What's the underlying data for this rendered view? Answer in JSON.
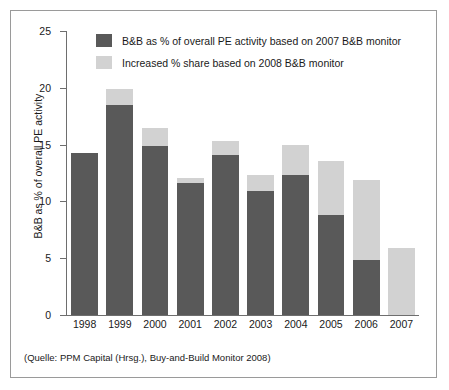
{
  "chart_data": {
    "type": "bar",
    "subtype": "stacked-vertical",
    "title": "",
    "xlabel": "",
    "ylabel": "B&B as % of overall PE activity",
    "ylim": [
      0,
      25
    ],
    "yticks": [
      0,
      5,
      10,
      15,
      20,
      25
    ],
    "grid": false,
    "legend_position": "top-left-inside",
    "categories": [
      "1998",
      "1999",
      "2000",
      "2001",
      "2002",
      "2003",
      "2004",
      "2005",
      "2006",
      "2007"
    ],
    "series": [
      {
        "name": "B&B as % of overall PE activity based on 2007 B&B monitor",
        "color": "#595959",
        "values": [
          14.3,
          18.5,
          14.9,
          11.6,
          14.1,
          10.9,
          12.3,
          8.8,
          4.8,
          0.0
        ]
      },
      {
        "name": "Increased % share based on 2008 B&B monitor",
        "color": "#d2d2d2",
        "values": [
          0.0,
          1.4,
          1.6,
          0.5,
          1.2,
          1.4,
          2.7,
          4.8,
          7.1,
          5.9
        ]
      }
    ],
    "totals": [
      14.3,
      19.9,
      16.5,
      12.1,
      15.3,
      12.3,
      15.0,
      13.6,
      11.9,
      5.9
    ],
    "annotations": [
      "(Quelle: PPM Capital (Hrsg.), Buy-and-Build Monitor 2008)"
    ]
  },
  "axis": {
    "y_title": "B&B as % of overall PE activity",
    "y_tick_labels": [
      "25",
      "20",
      "15",
      "10",
      "5",
      "0"
    ]
  },
  "legend": {
    "items": [
      {
        "label": "B&B as % of overall PE activity based on 2007 B&B monitor",
        "swatch": "dark-gray-swatch"
      },
      {
        "label": "Increased % share based on 2008 B&B monitor",
        "swatch": "light-gray-swatch"
      }
    ]
  },
  "source": {
    "text": "(Quelle: PPM Capital (Hrsg.), Buy-and-Build Monitor 2008)"
  },
  "colors": {
    "series_dark": "#595959",
    "series_light": "#d2d2d2",
    "axis": "#6e6e6e",
    "border": "#9a9a9a",
    "text": "#1a1a1a"
  }
}
